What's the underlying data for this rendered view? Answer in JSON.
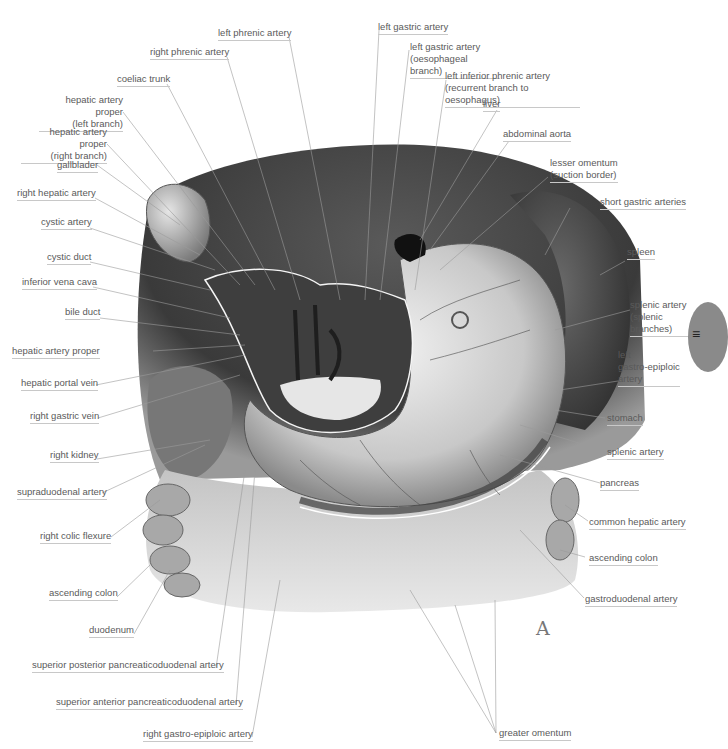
{
  "figure": {
    "letter": "A",
    "edge_tab_glyph": "≡"
  },
  "colors": {
    "label_text": "#5a5a5a",
    "leader_line": "#9a9a9a",
    "underline": "#c8c8c8",
    "liver_dark": "#3c3c3c",
    "tissue_light": "#d9d9d9",
    "omentum": "#cfcfcf"
  },
  "labels": {
    "left_phrenic_artery": "left phrenic artery",
    "right_phrenic_artery": "right phrenic artery",
    "coeliac_trunk": "coeliac trunk",
    "hepatic_artery_proper_left_1": "hepatic artery proper",
    "hepatic_artery_proper_left_2": "(left branch)",
    "hepatic_artery_proper_right_1": "hepatic artery proper",
    "hepatic_artery_proper_right_2": "(right branch)",
    "gallbladder": "gallblader",
    "right_hepatic_artery": "right hepatic artery",
    "cystic_artery": "cystic artery",
    "cystic_duct": "cystic duct",
    "inferior_vena_cava": "inferior vena cava",
    "bile_duct": "bile duct",
    "hepatic_artery_proper": "hepatic artery proper",
    "hepatic_portal_vein": "hepatic portal vein",
    "right_gastric_vein": "right gastric vein",
    "right_kidney": "right kidney",
    "supraduodenal_artery": "supraduodenal artery",
    "right_colic_flexure": "right colic flexure",
    "ascending_colon_left": "ascending colon",
    "duodenum": "duodenum",
    "superior_posterior_pd_artery": "superior posterior pancreaticoduodenal artery",
    "superior_anterior_pd_artery": "superior anterior pancreaticoduodenal artery",
    "right_gastro_epiploic_artery": "right gastro-epiploic artery",
    "left_gastric_artery": "left gastric artery",
    "left_gastric_artery_oes_1": "left gastric artery",
    "left_gastric_artery_oes_2": "(oesophageal branch)",
    "left_inferior_phrenic_1": "left inferior phrenic artery",
    "left_inferior_phrenic_2": "(recurrent branch to oesophagus)",
    "liver": "liver",
    "abdominal_aorta": "abdominal aorta",
    "lesser_omentum_1": "lesser omentum",
    "lesser_omentum_2": "(suction border)",
    "short_gastric_arteries": "short gastric arteries",
    "spleen": "spleen",
    "splenic_branches_1": "splenic artery",
    "splenic_branches_2": "(splenic",
    "splenic_branches_3": "branches)",
    "left_gastro_epiploic_1": "left",
    "left_gastro_epiploic_2": "gastro-epiploic",
    "left_gastro_epiploic_3": "artery",
    "stomach": "stomach",
    "splenic_artery": "splenic artery",
    "pancreas": "pancreas",
    "common_hepatic_artery": "common hepatic artery",
    "ascending_colon_right": "ascending colon",
    "gastroduodenal_artery": "gastroduodenal artery",
    "greater_omentum": "greater omentum"
  }
}
